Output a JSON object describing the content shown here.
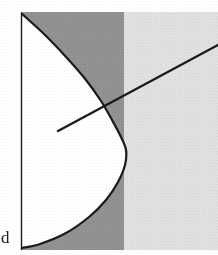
{
  "figure": {
    "width": 218,
    "height": 255,
    "background_color": "#ffffff"
  },
  "labels": {
    "d_label": "d"
  },
  "colors": {
    "dark_shade": "#8d8d8d",
    "light_shade": "#e3e3e3",
    "interior_fill": "#ffffff",
    "stroke": "#1a1a1a",
    "page_background": "#ffffff"
  },
  "chart_data": {
    "type": "area",
    "xlabel": "",
    "ylabel": "",
    "xlim": [
      0,
      218
    ],
    "ylim": [
      0,
      255
    ],
    "grid": false,
    "legend": null,
    "regions": [
      {
        "name": "dark-shaded-band",
        "fill": "#8d8d8d",
        "x_range": [
          21,
          124
        ],
        "y_range": [
          12,
          250
        ]
      },
      {
        "name": "light-shaded-band",
        "fill": "#e3e3e3",
        "x_range": [
          124,
          218
        ],
        "y_range": [
          12,
          250
        ]
      },
      {
        "name": "parabola-interior",
        "fill": "#ffffff",
        "description": "white region bounded left by vertical axis and right by leftward-opening parabola"
      }
    ],
    "series": [
      {
        "name": "parabola",
        "type": "curve",
        "orientation": "opens-left",
        "vertex": [
          126,
          150
        ],
        "endpoints": [
          [
            21,
            13
          ],
          [
            22,
            248
          ]
        ],
        "stroke": "#1a1a1a",
        "stroke_width": 2.2,
        "points": [
          [
            21,
            13
          ],
          [
            45,
            35
          ],
          [
            67,
            58
          ],
          [
            86,
            80
          ],
          [
            101,
            101
          ],
          [
            112,
            120
          ],
          [
            121,
            137
          ],
          [
            126,
            150
          ],
          [
            125,
            165
          ],
          [
            118,
            182
          ],
          [
            106,
            200
          ],
          [
            89,
            217
          ],
          [
            66,
            233
          ],
          [
            40,
            244
          ],
          [
            22,
            248
          ]
        ]
      },
      {
        "name": "vertical-axis",
        "type": "line",
        "endpoints": [
          [
            21,
            13
          ],
          [
            21,
            250
          ]
        ],
        "stroke": "#1a1a1a",
        "stroke_width": 1.4
      },
      {
        "name": "secant-line",
        "type": "line",
        "endpoints": [
          [
            58,
            131
          ],
          [
            218,
            45
          ]
        ],
        "stroke": "#1a1a1a",
        "stroke_width": 2.4,
        "crosses_parabola_at": [
          112,
          103
        ]
      }
    ],
    "annotations": [
      {
        "text": "d",
        "x": 6,
        "y": 243,
        "anchor": "left"
      }
    ]
  }
}
